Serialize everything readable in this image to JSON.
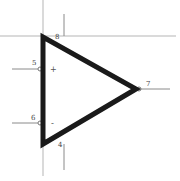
{
  "diagram": {
    "type": "op-amp-symbol",
    "colors": {
      "body_stroke": "#1a1a1a",
      "wire": "#8a8a8a",
      "grid_line": "#b5b5b5",
      "label": "#444444",
      "background": "#ffffff"
    },
    "pins": {
      "non_inverting_input": {
        "number": "5",
        "sign": "+"
      },
      "inverting_input": {
        "number": "6",
        "sign": "-"
      },
      "output": {
        "number": "7"
      },
      "positive_supply": {
        "number": "8"
      },
      "negative_supply": {
        "number": "4"
      }
    }
  }
}
